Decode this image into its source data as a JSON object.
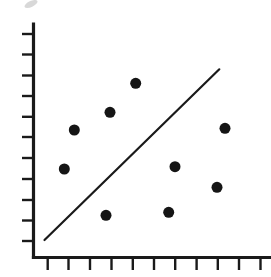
{
  "chart_data": {
    "type": "scatter",
    "title": "",
    "xlabel": "",
    "ylabel": "",
    "grid": false,
    "legend": null,
    "x_ticks": 11,
    "y_ticks": 11,
    "xlim": [
      0,
      10.5
    ],
    "ylim": [
      0,
      11
    ],
    "x_tick_labels": [],
    "y_tick_labels": [],
    "points": [
      {
        "x": 0.8,
        "y": 4.2
      },
      {
        "x": 1.3,
        "y": 6.1
      },
      {
        "x": 2.9,
        "y": 2.0
      },
      {
        "x": 3.0,
        "y": 7.0
      },
      {
        "x": 4.2,
        "y": 8.4
      },
      {
        "x": 6.0,
        "y": 2.2
      },
      {
        "x": 6.4,
        "y": 4.4
      },
      {
        "x": 8.5,
        "y": 3.4
      },
      {
        "x": 8.9,
        "y": 6.2
      }
    ],
    "series": [
      {
        "name": "points",
        "type": "scatter"
      },
      {
        "name": "trend line",
        "type": "line",
        "from": {
          "x": 0.5,
          "y": 0.8
        },
        "to": {
          "x": 8.6,
          "y": 9.1
        }
      }
    ]
  },
  "colors": {
    "ink": "#1a1a1a",
    "background": "#ffffff"
  },
  "layout": {
    "origin_px": [
      33,
      257
    ],
    "x_tick_px": [
      47.7,
      68.5,
      90,
      111.5,
      132.8,
      154,
      175.2,
      196.6,
      217.8,
      239,
      260.5
    ],
    "y_tick_px": [
      34,
      54.5,
      75.5,
      96,
      116.8,
      137,
      158,
      179,
      200,
      220.5,
      241
    ],
    "point_px": [
      [
        64.3,
        169
      ],
      [
        74.3,
        130
      ],
      [
        106,
        215.3
      ],
      [
        110,
        112.3
      ],
      [
        135.7,
        83.3
      ],
      [
        168.7,
        212.3
      ],
      [
        175,
        166.7
      ],
      [
        217,
        187.3
      ],
      [
        225,
        128.3
      ]
    ],
    "line_px": [
      [
        44.5,
        240
      ],
      [
        219.3,
        69.3
      ]
    ]
  }
}
